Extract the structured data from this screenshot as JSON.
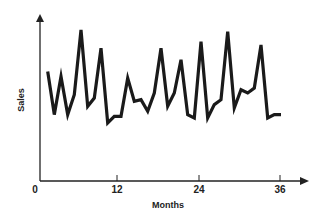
{
  "chart_data": {
    "type": "line",
    "title": "",
    "xlabel": "Months",
    "ylabel": "Sales",
    "xlim": [
      0,
      37
    ],
    "ylim": [
      0,
      100
    ],
    "grid": false,
    "legend": null,
    "x_ticks": [
      0,
      12,
      24,
      36
    ],
    "x_tick_labels": [
      "0",
      "12",
      "24",
      "36"
    ],
    "y_ticks": [],
    "y_units": "relative (no scale shown)",
    "series": [
      {
        "name": "Sales",
        "color": "#1a1a1a",
        "x": [
          1,
          2,
          3,
          4,
          5,
          6,
          7,
          8,
          9,
          10,
          11,
          12,
          13,
          14,
          15,
          16,
          17,
          18,
          19,
          20,
          21,
          22,
          23,
          24,
          25,
          26,
          27,
          28,
          29,
          30,
          31,
          32,
          33,
          34,
          35,
          36
        ],
        "values": [
          66,
          40,
          63,
          40,
          52,
          91,
          45,
          50,
          80,
          35,
          39,
          39,
          62,
          48,
          49,
          42,
          53,
          80,
          45,
          53,
          73,
          40,
          38,
          84,
          38,
          46,
          49,
          90,
          44,
          55,
          53,
          56,
          82,
          38,
          40,
          40
        ]
      }
    ]
  },
  "axes": {
    "x_label": "Months",
    "y_label": "Sales",
    "origin_label": "0",
    "tick_12": "12",
    "tick_24": "24",
    "tick_36": "36"
  }
}
